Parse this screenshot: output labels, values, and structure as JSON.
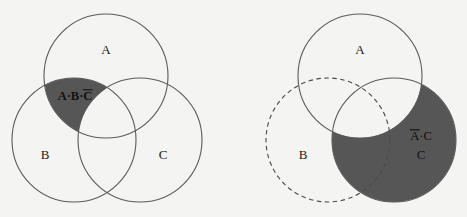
{
  "figure": {
    "kind": "venn-diagram-pair",
    "background_color": "#f4f4f2",
    "stroke_color": "#5a5a5a",
    "shade_color": "#565656",
    "text_color": "#141414"
  },
  "left_diagram": {
    "name": "three-set-venn-intersection-minus-c",
    "circles": [
      {
        "id": "A",
        "label": "A",
        "stroke": "solid",
        "filled": false,
        "cx": 106,
        "cy": 76,
        "r": 62,
        "label_x": 106,
        "label_y": 54
      },
      {
        "id": "B",
        "label": "B",
        "stroke": "solid",
        "filled": false,
        "cx": 74,
        "cy": 140,
        "r": 62,
        "label_x": 45,
        "label_y": 159
      },
      {
        "id": "C",
        "label": "C",
        "stroke": "solid",
        "filled": false,
        "cx": 140,
        "cy": 140,
        "r": 62,
        "label_x": 163,
        "label_y": 159
      }
    ],
    "shaded_region": {
      "expression": "A·B·C̄",
      "parts": [
        "A",
        "·",
        "B",
        "·",
        "C"
      ],
      "overline_over": [
        "C"
      ],
      "description": "A AND B AND NOT C",
      "label_x": 75,
      "label_y": 100
    }
  },
  "right_diagram": {
    "name": "three-set-venn-c-minus-a",
    "circles": [
      {
        "id": "A",
        "label": "A",
        "stroke": "solid",
        "filled": false,
        "cx": 360,
        "cy": 76,
        "r": 62,
        "label_x": 360,
        "label_y": 54
      },
      {
        "id": "B",
        "label": "B",
        "stroke": "dashed",
        "filled": false,
        "cx": 328,
        "cy": 140,
        "r": 62,
        "label_x": 303,
        "label_y": 159
      },
      {
        "id": "C",
        "label": "C",
        "stroke": "solid",
        "filled": true,
        "cx": 394,
        "cy": 140,
        "r": 62,
        "label_x": 421,
        "label_y": 159
      }
    ],
    "shaded_region": {
      "expression": "Ā·C",
      "parts": [
        "A",
        "·",
        "C"
      ],
      "overline_over": [
        "A"
      ],
      "description": "NOT A AND C",
      "label_x": 421,
      "label_y": 140
    }
  }
}
